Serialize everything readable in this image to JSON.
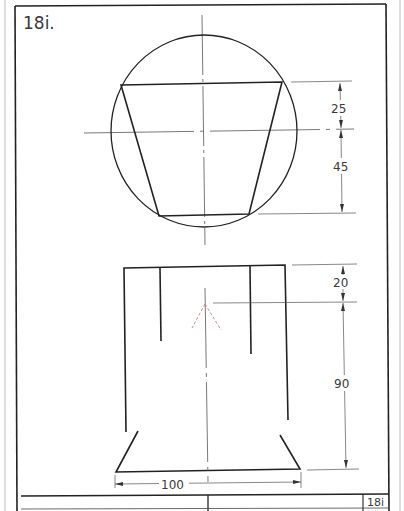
{
  "drawing": {
    "label": "18i.",
    "title_block_number": "18i",
    "colors": {
      "paper": "#ffffff",
      "line": "#222222",
      "thin_line": "#555555",
      "hidden_line": "#c08080",
      "text": "#3a3a3a"
    }
  },
  "top_view": {
    "dimensions": [
      {
        "name": "upper",
        "value": "25"
      },
      {
        "name": "lower",
        "value": "45"
      }
    ]
  },
  "front_view": {
    "dimensions": [
      {
        "name": "top-offset",
        "value": "20"
      },
      {
        "name": "height",
        "value": "90"
      },
      {
        "name": "base-width",
        "value": "100"
      }
    ]
  }
}
